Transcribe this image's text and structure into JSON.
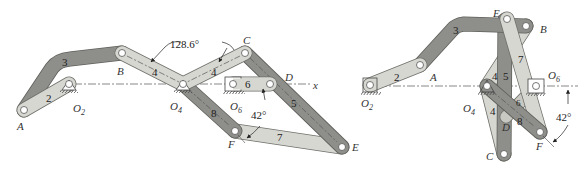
{
  "colors": {
    "link_light": "#d7d7d2",
    "link_dark": "#8e8e8a",
    "link_mid": "#a9a9a4",
    "outline": "#6f6f6b",
    "centerline": "#555555",
    "text": "#333333"
  },
  "left_diagram": {
    "points": {
      "A": "A",
      "B": "B",
      "C": "C",
      "D": "D",
      "E": "E",
      "F": "F",
      "O2": "O",
      "O2_sub": "2",
      "O4": "O",
      "O4_sub": "4",
      "O6": "O",
      "O6_sub": "6"
    },
    "link_numbers": {
      "l2": "2",
      "l3": "3",
      "l4a": "4",
      "l4b": "4",
      "l5": "5",
      "l6": "6",
      "l7": "7",
      "l8": "8"
    },
    "axis_label": "x",
    "angle_128": "128.6°",
    "angle_42": "42°"
  },
  "right_diagram": {
    "points": {
      "A": "A",
      "B": "B",
      "C": "C",
      "D": "D",
      "E": "E",
      "F": "F",
      "O2": "O",
      "O2_sub": "2",
      "O4": "O",
      "O4_sub": "4",
      "O6": "O",
      "O6_sub": "6"
    },
    "link_numbers": {
      "l2": "2",
      "l3": "3",
      "l4a": "4",
      "l4b": "4",
      "l5": "5",
      "l6": "6",
      "l7": "7",
      "l8": "8"
    },
    "angle_42": "42°"
  }
}
